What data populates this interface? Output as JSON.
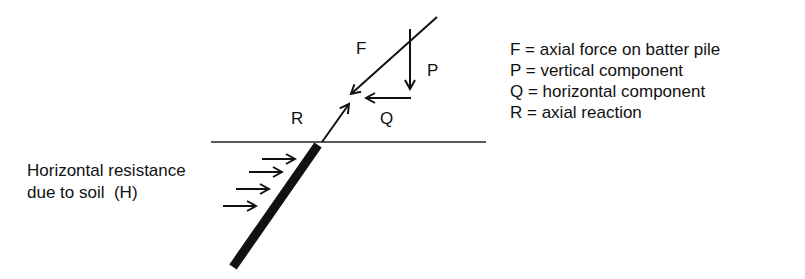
{
  "diagram": {
    "labels": {
      "F": "F",
      "P": "P",
      "Q": "Q",
      "R": "R"
    },
    "soil_label": {
      "line1": "Horizontal resistance",
      "line2": "due to soil  (H)"
    },
    "legend": [
      {
        "text": "F = axial force on batter pile"
      },
      {
        "text": "P = vertical component"
      },
      {
        "text": "Q = horizontal component"
      },
      {
        "text": "R = axial reaction"
      }
    ],
    "colors": {
      "stroke": "#111111",
      "background": "#ffffff"
    }
  }
}
